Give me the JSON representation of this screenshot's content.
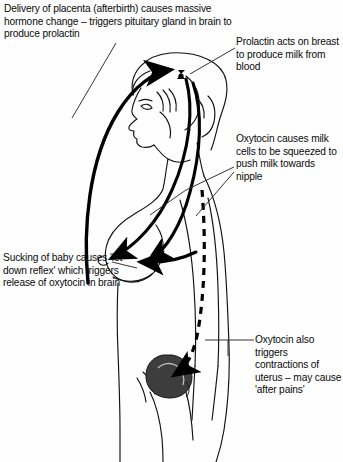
{
  "figure": {
    "type": "medical-diagram",
    "background_color": "#fefefe",
    "ink_color": "#000000",
    "uterus_fill": "#3d3d3d"
  },
  "captions": {
    "placenta": "Delivery of placenta (afterbirth) causes massive hormone change – triggers pituitary gland in brain to produce prolactin",
    "prolactin": "Prolactin acts on breast to produce milk from blood",
    "oxytocin_milk": "Oxytocin causes milk cells to be squeezed to push milk towards nipple",
    "sucking": "Sucking of baby causes 'let down reflex' which triggers release of oxytocin in brain",
    "oxytocin_uterus": "Oxytocin also triggers contractions of uterus – may cause 'after pains'"
  },
  "anatomy": {
    "pituitary_gland": "pituitary-gland-marker",
    "breast": "breast-outline",
    "nipple": "nipple",
    "uterus": "uterus-shape",
    "head": "head-profile",
    "torso": "torso-outline"
  },
  "arrows": {
    "placenta_to_pituitary": "bold curved arrow sweeping from breast area up over head to pituitary",
    "prolactin_to_breast": "bold curve from pituitary down to breast",
    "oxytocin_to_nipple": "bold arrow pointing left toward nipple",
    "oxytocin_to_uterus": "dashed arrow descending to uterus"
  }
}
